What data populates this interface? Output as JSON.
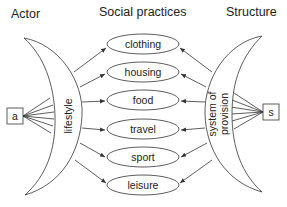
{
  "headers": {
    "actor": "Actor",
    "social_practices": "Social practices",
    "structure": "Structure"
  },
  "actor_box": {
    "label": "a"
  },
  "structure_box": {
    "label": "s"
  },
  "left_crescent": {
    "label": "lifestyle"
  },
  "right_crescent": {
    "label_line1": "system of",
    "label_line2": "provision"
  },
  "practices": [
    {
      "label": "clothing"
    },
    {
      "label": "housing"
    },
    {
      "label": "food"
    },
    {
      "label": "travel"
    },
    {
      "label": "sport"
    },
    {
      "label": "leisure"
    }
  ],
  "colors": {
    "line": "#333333",
    "text": "#222222",
    "background": "#ffffff"
  }
}
